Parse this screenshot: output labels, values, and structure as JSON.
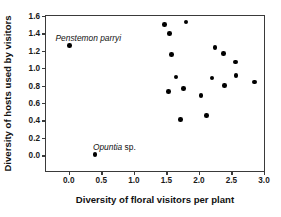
{
  "chart_data": {
    "type": "scatter",
    "title": "",
    "xlabel": "Diversity of floral visitors per plant",
    "ylabel": "Diversity of hosts used by visitors",
    "xlim": [
      -0.35,
      3.0
    ],
    "ylim": [
      -0.18,
      1.6
    ],
    "grid": false,
    "legend": null,
    "xticks": [
      "0.0",
      "0.5",
      "1.0",
      "1.5",
      "2.0",
      "2.5",
      "3.0"
    ],
    "xtick_values": [
      0.0,
      0.5,
      1.0,
      1.5,
      2.0,
      2.5,
      3.0
    ],
    "yticks": [
      "0.0",
      "0.2",
      "0.4",
      "0.6",
      "0.8",
      "1.0",
      "1.2",
      "1.4",
      "1.6"
    ],
    "ytick_values": [
      0.0,
      0.2,
      0.4,
      0.6,
      0.8,
      1.0,
      1.2,
      1.4,
      1.6
    ],
    "marker": "filled-circle",
    "marker_color": "#000000",
    "points": [
      {
        "x": 0.01,
        "y": 1.26
      },
      {
        "x": 0.4,
        "y": 0.01
      },
      {
        "x": 1.47,
        "y": 1.5
      },
      {
        "x": 1.55,
        "y": 1.4
      },
      {
        "x": 1.8,
        "y": 1.53
      },
      {
        "x": 1.58,
        "y": 1.16
      },
      {
        "x": 1.65,
        "y": 0.9
      },
      {
        "x": 1.53,
        "y": 0.73
      },
      {
        "x": 1.76,
        "y": 0.77
      },
      {
        "x": 1.72,
        "y": 0.41
      },
      {
        "x": 2.03,
        "y": 0.69
      },
      {
        "x": 2.12,
        "y": 0.46
      },
      {
        "x": 2.2,
        "y": 0.89
      },
      {
        "x": 2.25,
        "y": 1.24
      },
      {
        "x": 2.38,
        "y": 1.17
      },
      {
        "x": 2.39,
        "y": 0.8
      },
      {
        "x": 2.56,
        "y": 1.07
      },
      {
        "x": 2.57,
        "y": 0.92
      },
      {
        "x": 2.85,
        "y": 0.84
      }
    ],
    "annotations": [
      {
        "genus": "Penstemon parryi",
        "suffix": "",
        "x": 0.3,
        "y": 1.4
      },
      {
        "genus": "Opuntia",
        "suffix": " sp.",
        "x": 0.7,
        "y": 0.15
      }
    ]
  }
}
